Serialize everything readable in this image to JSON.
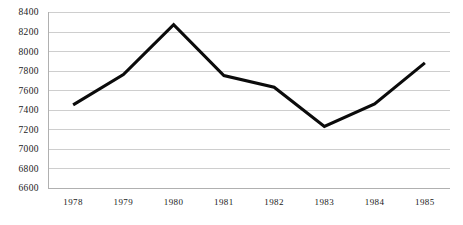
{
  "chart_data": {
    "type": "line",
    "title": "",
    "subtitle": "",
    "xlabel": "",
    "ylabel": "",
    "categories": [
      "1978",
      "1979",
      "1980",
      "1981",
      "1982",
      "1983",
      "1984",
      "1985"
    ],
    "values": [
      7450,
      7760,
      8270,
      7750,
      7630,
      7230,
      7460,
      7880
    ],
    "series": [
      {
        "name": "",
        "values": [
          7450,
          7760,
          8270,
          7750,
          7630,
          7230,
          7460,
          7880
        ],
        "color": "#0b0b0b"
      }
    ],
    "ylim": [
      6600,
      8400
    ],
    "yticks": [
      6600,
      6800,
      7000,
      7200,
      7400,
      7600,
      7800,
      8000,
      8200,
      8400
    ],
    "ytick_labels": [
      "6600",
      "6800",
      "7000",
      "7200",
      "7400",
      "7600",
      "7800",
      "8000",
      "8200",
      "8400"
    ],
    "xtick_labels": [
      "1978",
      "1979",
      "1980",
      "1981",
      "1982",
      "1983",
      "1984",
      "1985"
    ],
    "grid": true,
    "grid_axis": "y",
    "legend": false,
    "legend_position": "none",
    "markers": false,
    "line_width": 3,
    "grid_color": "#c9c9c9",
    "axis_color": "#b0b0b0",
    "background_color": "#ffffff",
    "annotations": []
  },
  "layout": {
    "plot_left": 48,
    "plot_right": 450,
    "plot_top": 12,
    "plot_bottom": 188
  }
}
